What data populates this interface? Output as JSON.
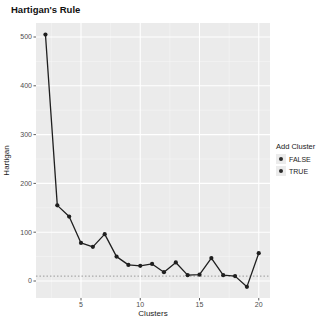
{
  "title": "Hartigan's Rule",
  "colors": {
    "panel_bg": "#ebebeb",
    "grid_major": "#ffffff",
    "grid_minor": "#ffffff",
    "line": "#1f1f1f",
    "point": "#1f1f1f",
    "threshold_line": "#999999",
    "tick_label": "#4d4d4d",
    "tick_mark": "#333333",
    "axis_title": "#1a1a1a"
  },
  "chart_data": {
    "type": "line",
    "title": "Hartigan's Rule",
    "xlabel": "Clusters",
    "ylabel": "Hartigan",
    "x": [
      2,
      3,
      4,
      5,
      6,
      7,
      8,
      9,
      10,
      11,
      12,
      13,
      14,
      15,
      16,
      17,
      18,
      19,
      20
    ],
    "values": [
      505,
      155,
      132,
      78,
      70,
      96,
      50,
      33,
      31,
      35,
      18,
      38,
      12,
      13,
      47,
      12,
      10,
      -12,
      57
    ],
    "threshold": 10,
    "threshold_style": "dotted",
    "xticks": [
      5,
      10,
      15,
      20
    ],
    "yticks": [
      0,
      100,
      200,
      300,
      400,
      500
    ],
    "xtick_labels": [
      "5",
      "10",
      "15",
      "20"
    ],
    "ytick_labels": [
      "0",
      "100",
      "200",
      "300",
      "400",
      "500"
    ],
    "xlim": [
      1.2,
      20.95
    ],
    "ylim": [
      -34.8,
      528.7
    ],
    "grid": true,
    "legend": {
      "title": "Add Cluster",
      "entries": [
        {
          "label": "FALSE"
        },
        {
          "label": "TRUE"
        }
      ],
      "position": "right"
    }
  }
}
